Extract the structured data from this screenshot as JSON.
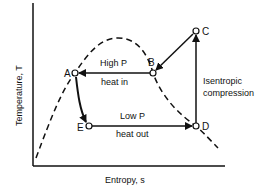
{
  "diagram": {
    "type": "T-s diagram (vapor-compression refrigeration cycle)",
    "axes": {
      "xlabel": "Entropy, s",
      "ylabel": "Temperature, T"
    },
    "points": [
      {
        "id": "A",
        "label": "A"
      },
      {
        "id": "B",
        "label": "B"
      },
      {
        "id": "C",
        "label": "C"
      },
      {
        "id": "D",
        "label": "D"
      },
      {
        "id": "E",
        "label": "E"
      }
    ],
    "processes": {
      "high_p": {
        "label": "High P",
        "sublabel": "heat in"
      },
      "low_p": {
        "label": "Low P",
        "sublabel": "heat out"
      },
      "compression": {
        "line1": "Isentropic",
        "line2": "compression"
      }
    },
    "colors": {
      "ink": "#111111",
      "background": "#ffffff"
    }
  }
}
